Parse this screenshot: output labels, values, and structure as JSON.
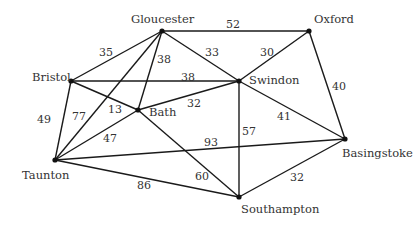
{
  "nodes": [
    {
      "id": "gloucester",
      "label": "Gloucester",
      "x": 162,
      "y": 31,
      "lx": 131,
      "ly": 23
    },
    {
      "id": "oxford",
      "label": "Oxford",
      "x": 309,
      "y": 31,
      "lx": 314,
      "ly": 23
    },
    {
      "id": "bristol",
      "label": "Bristol",
      "x": 71,
      "y": 81,
      "lx": 32,
      "ly": 81
    },
    {
      "id": "swindon",
      "label": "Swindon",
      "x": 239,
      "y": 81,
      "lx": 249,
      "ly": 84
    },
    {
      "id": "bath",
      "label": "Bath",
      "x": 138,
      "y": 110,
      "lx": 149,
      "ly": 116
    },
    {
      "id": "taunton",
      "label": "Taunton",
      "x": 55,
      "y": 160,
      "lx": 22,
      "ly": 179
    },
    {
      "id": "basingstoke",
      "label": "Basingstoke",
      "x": 345,
      "y": 139,
      "lx": 342,
      "ly": 157
    },
    {
      "id": "southampton",
      "label": "Southampton",
      "x": 239,
      "y": 197,
      "lx": 241,
      "ly": 213
    }
  ],
  "edges": [
    {
      "from": "gloucester",
      "to": "oxford",
      "weight": "52",
      "wx": 226,
      "wy": 28
    },
    {
      "from": "gloucester",
      "to": "bristol",
      "weight": "35",
      "wx": 99,
      "wy": 56
    },
    {
      "from": "gloucester",
      "to": "swindon",
      "weight": "33",
      "wx": 205,
      "wy": 56
    },
    {
      "from": "gloucester",
      "to": "bath",
      "weight": "38",
      "wx": 157,
      "wy": 63
    },
    {
      "from": "gloucester",
      "to": "taunton",
      "weight": "77",
      "wx": 72,
      "wy": 120
    },
    {
      "from": "oxford",
      "to": "swindon",
      "weight": "30",
      "wx": 260,
      "wy": 56
    },
    {
      "from": "oxford",
      "to": "basingstoke",
      "weight": "40",
      "wx": 332,
      "wy": 90
    },
    {
      "from": "bristol",
      "to": "swindon",
      "weight": "38",
      "wx": 181,
      "wy": 81
    },
    {
      "from": "bristol",
      "to": "bath",
      "weight": "13",
      "wx": 108,
      "wy": 113
    },
    {
      "from": "bristol",
      "to": "taunton",
      "weight": "49",
      "wx": 37,
      "wy": 123
    },
    {
      "from": "bath",
      "to": "swindon",
      "weight": "32",
      "wx": 187,
      "wy": 107
    },
    {
      "from": "bath",
      "to": "taunton",
      "weight": "47",
      "wx": 103,
      "wy": 142
    },
    {
      "from": "bath",
      "to": "southampton",
      "weight": "60",
      "wx": 195,
      "wy": 180
    },
    {
      "from": "taunton",
      "to": "basingstoke",
      "weight": "93",
      "wx": 204,
      "wy": 146
    },
    {
      "from": "taunton",
      "to": "southampton",
      "weight": "86",
      "wx": 137,
      "wy": 189
    },
    {
      "from": "swindon",
      "to": "southampton",
      "weight": "57",
      "wx": 242,
      "wy": 135
    },
    {
      "from": "swindon",
      "to": "basingstoke",
      "weight": "41",
      "wx": 277,
      "wy": 120
    },
    {
      "from": "southampton",
      "to": "basingstoke",
      "weight": "32",
      "wx": 290,
      "wy": 181
    }
  ]
}
